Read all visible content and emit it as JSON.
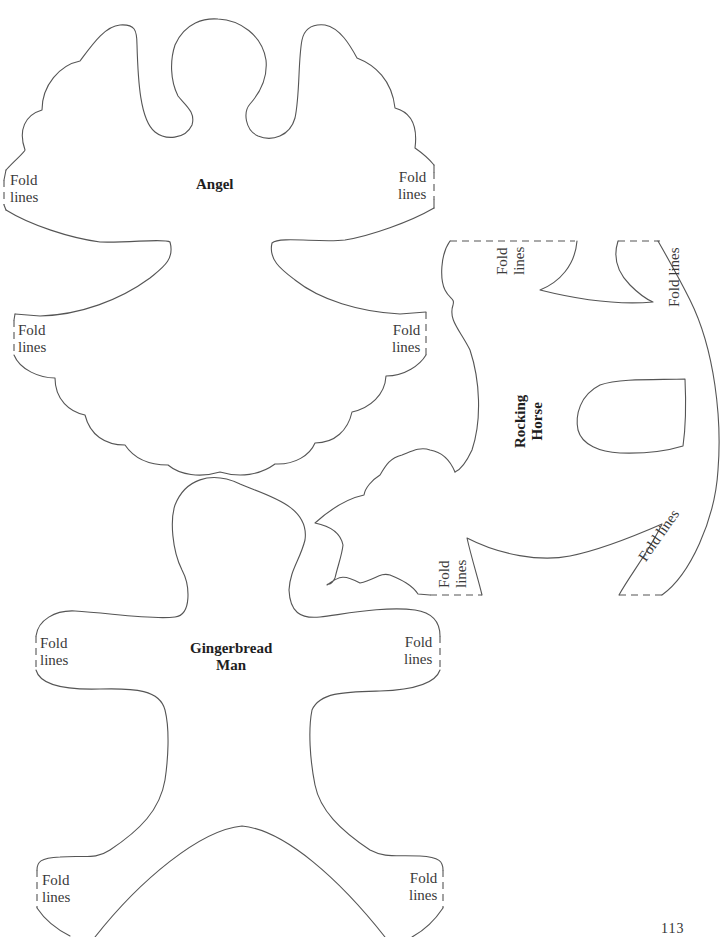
{
  "templates": {
    "angel": {
      "title": "Angel",
      "fold_labels": [
        {
          "line1": "Fold",
          "line2": "lines",
          "position": "upper-left"
        },
        {
          "line1": "Fold",
          "line2": "lines",
          "position": "upper-right"
        },
        {
          "line1": "Fold",
          "line2": "lines",
          "position": "lower-left"
        },
        {
          "line1": "Fold",
          "line2": "lines",
          "position": "lower-right"
        }
      ]
    },
    "rocking_horse": {
      "title_line1": "Rocking",
      "title_line2": "Horse",
      "fold_labels": [
        {
          "line1": "Fold",
          "line2": "lines",
          "position": "top-left"
        },
        {
          "line1": "Fold lines",
          "position": "top-right"
        },
        {
          "line1": "Fold",
          "line2": "lines",
          "position": "bottom-left"
        },
        {
          "line1": "Fold lines",
          "position": "bottom-right"
        }
      ]
    },
    "gingerbread_man": {
      "title_line1": "Gingerbread",
      "title_line2": "Man",
      "fold_labels": [
        {
          "line1": "Fold",
          "line2": "lines",
          "position": "arm-left"
        },
        {
          "line1": "Fold",
          "line2": "lines",
          "position": "arm-right"
        },
        {
          "line1": "Fold",
          "line2": "lines",
          "position": "leg-left"
        },
        {
          "line1": "Fold",
          "line2": "lines",
          "position": "leg-right"
        }
      ]
    }
  },
  "page_number": "113"
}
